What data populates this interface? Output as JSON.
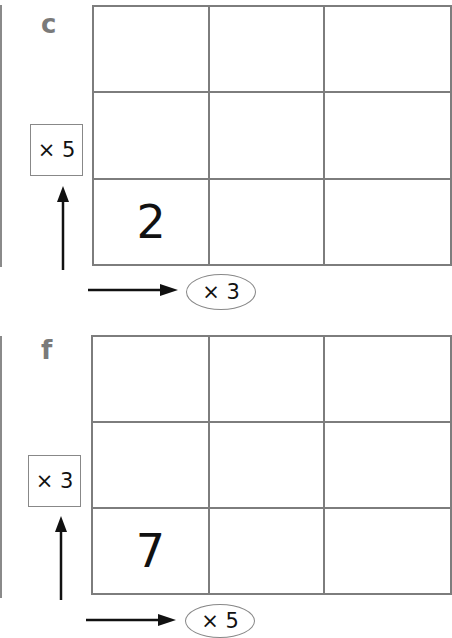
{
  "panels": [
    {
      "label": "c",
      "start_value": "2",
      "vertical_factor": "× 5",
      "horizontal_factor": "× 3",
      "grid": {
        "rows": 3,
        "cols": 3,
        "filled_cell": "bottom-left"
      }
    },
    {
      "label": "f",
      "start_value": "7",
      "vertical_factor": "× 3",
      "horizontal_factor": "× 5",
      "grid": {
        "rows": 3,
        "cols": 3,
        "filled_cell": "bottom-left"
      }
    }
  ],
  "colors": {
    "grid_line": "#7d7d7d",
    "label": "#7a7a7a",
    "text": "#111111"
  }
}
